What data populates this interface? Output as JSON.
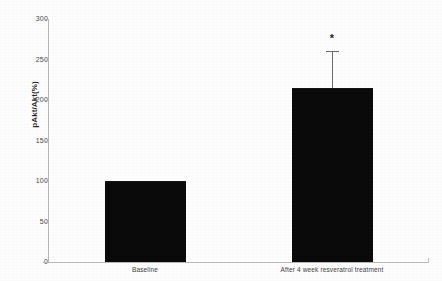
{
  "chart_data": {
    "type": "bar",
    "title": "",
    "xlabel": "",
    "ylabel": "pAkt/Akt(%)",
    "categories": [
      "Baseline",
      "After 4 week resveratrol treatment"
    ],
    "values": [
      100,
      215
    ],
    "errors": [
      null,
      45
    ],
    "error_upper": [
      null,
      260
    ],
    "annotations": [
      {
        "category": "After 4 week resveratrol treatment",
        "text": "*",
        "meaning": "significance-marker"
      }
    ],
    "ylim": [
      0,
      300
    ],
    "yticks": [
      0,
      50,
      100,
      150,
      200,
      250,
      300
    ],
    "ytick_labels": [
      "0",
      "50",
      "100",
      "150",
      "200",
      "250",
      "300"
    ],
    "grid": false,
    "legend": "none",
    "bar_color": "#0a0a0a",
    "axis_color": "#b9b9b9",
    "background_color": "#fdfdfd"
  },
  "axis": {
    "y_title": "pAkt/Akt(%)",
    "ticks": [
      {
        "label": "300",
        "value": 300
      },
      {
        "label": "250",
        "value": 250
      },
      {
        "label": "200",
        "value": 200
      },
      {
        "label": "150",
        "value": 150
      },
      {
        "label": "100",
        "value": 100
      },
      {
        "label": "50",
        "value": 50
      },
      {
        "label": "0",
        "value": 0
      }
    ]
  },
  "bars": [
    {
      "label": "Baseline",
      "value": 100,
      "marker": ""
    },
    {
      "label": "After 4 week resveratrol treatment",
      "value": 215,
      "marker": "*"
    }
  ]
}
